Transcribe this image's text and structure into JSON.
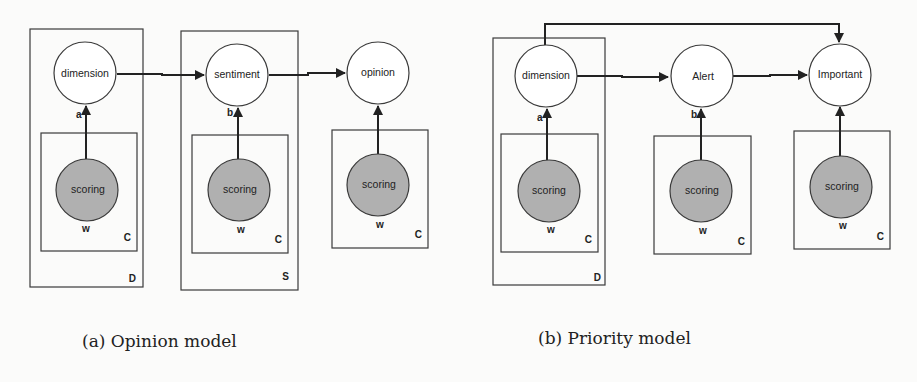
{
  "figure": {
    "subfigures": [
      {
        "id": "a",
        "caption": "(a) Opinion model",
        "nodes": [
          {
            "id": "a-dimension",
            "label": "dimension",
            "type": "latent"
          },
          {
            "id": "a-sentiment",
            "label": "sentiment",
            "type": "latent"
          },
          {
            "id": "a-opinion",
            "label": "opinion",
            "type": "latent"
          },
          {
            "id": "a-scoring-1",
            "label": "scoring",
            "type": "observed"
          },
          {
            "id": "a-scoring-2",
            "label": "scoring",
            "type": "observed"
          },
          {
            "id": "a-scoring-3",
            "label": "scoring",
            "type": "observed"
          }
        ],
        "edges": [
          {
            "from": "a-dimension",
            "to": "a-sentiment"
          },
          {
            "from": "a-sentiment",
            "to": "a-opinion"
          },
          {
            "from": "a-scoring-1",
            "to": "a-dimension",
            "label": "a"
          },
          {
            "from": "a-scoring-2",
            "to": "a-sentiment",
            "label": "b"
          },
          {
            "from": "a-scoring-3",
            "to": "a-opinion"
          }
        ],
        "plates": [
          {
            "id": "a-plate-D",
            "label": "D"
          },
          {
            "id": "a-plate-S",
            "label": "S"
          },
          {
            "id": "a-plate-C1",
            "label": "C"
          },
          {
            "id": "a-plate-C2",
            "label": "C"
          },
          {
            "id": "a-plate-C3",
            "label": "C"
          }
        ],
        "observed_variable_label": "w"
      },
      {
        "id": "b",
        "caption": "(b) Priority model",
        "nodes": [
          {
            "id": "b-dimension",
            "label": "dimension",
            "type": "latent"
          },
          {
            "id": "b-alert",
            "label": "Alert",
            "type": "latent"
          },
          {
            "id": "b-important",
            "label": "Important",
            "type": "latent"
          },
          {
            "id": "b-scoring-1",
            "label": "scoring",
            "type": "observed"
          },
          {
            "id": "b-scoring-2",
            "label": "scoring",
            "type": "observed"
          },
          {
            "id": "b-scoring-3",
            "label": "scoring",
            "type": "observed"
          }
        ],
        "edges": [
          {
            "from": "b-dimension",
            "to": "b-alert"
          },
          {
            "from": "b-alert",
            "to": "b-important"
          },
          {
            "from": "b-dimension",
            "to": "b-important",
            "routing": "over-top"
          },
          {
            "from": "b-scoring-1",
            "to": "b-dimension",
            "label": "a"
          },
          {
            "from": "b-scoring-2",
            "to": "b-alert",
            "label": "b"
          },
          {
            "from": "b-scoring-3",
            "to": "b-important"
          }
        ],
        "plates": [
          {
            "id": "b-plate-D",
            "label": "D"
          },
          {
            "id": "b-plate-C1",
            "label": "C"
          },
          {
            "id": "b-plate-C2",
            "label": "C"
          },
          {
            "id": "b-plate-C3",
            "label": "C"
          }
        ],
        "observed_variable_label": "w"
      }
    ],
    "colors": {
      "latent_fill": "#ffffff",
      "observed_fill": "#b0b0b0",
      "stroke": "#3a3a3a",
      "background": "#fbfbfa"
    }
  }
}
